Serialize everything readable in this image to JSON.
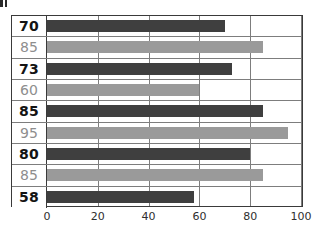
{
  "chart_data": {
    "type": "bar",
    "orientation": "horizontal",
    "title": "",
    "xlabel": "",
    "ylabel": "",
    "xlim": [
      0,
      100
    ],
    "xticks": [
      0,
      20,
      40,
      60,
      80,
      100
    ],
    "grid": true,
    "legend": false,
    "categories": [
      "70",
      "85",
      "73",
      "60",
      "85",
      "95",
      "80",
      "85",
      "58"
    ],
    "values": [
      70,
      85,
      73,
      60,
      85,
      95,
      80,
      85,
      58
    ],
    "bars": [
      {
        "label": "70",
        "value": 70,
        "style": "dark",
        "label_style": "dark"
      },
      {
        "label": "85",
        "value": 85,
        "style": "light",
        "label_style": "light"
      },
      {
        "label": "73",
        "value": 73,
        "style": "dark",
        "label_style": "dark"
      },
      {
        "label": "60",
        "value": 60,
        "style": "light",
        "label_style": "light"
      },
      {
        "label": "85",
        "value": 85,
        "style": "dark",
        "label_style": "dark"
      },
      {
        "label": "95",
        "value": 95,
        "style": "light",
        "label_style": "light"
      },
      {
        "label": "80",
        "value": 80,
        "style": "dark",
        "label_style": "dark"
      },
      {
        "label": "85",
        "value": 85,
        "style": "light",
        "label_style": "light"
      },
      {
        "label": "58",
        "value": 58,
        "style": "dark",
        "label_style": "dark"
      }
    ],
    "colors": {
      "bar_dark": "#3f3f3f",
      "bar_light": "#9a9a9a",
      "label_dark": "#141414",
      "label_light": "#8e8e8e",
      "grid_line": "#7d7d7d",
      "border": "#3a3a3a",
      "background": "#ffffff"
    }
  }
}
